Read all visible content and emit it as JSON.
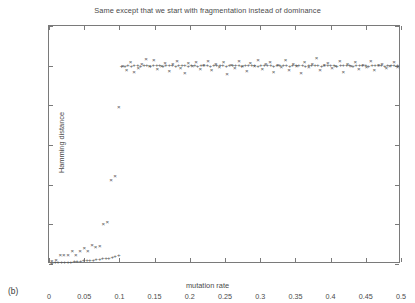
{
  "panel": {
    "label": "(b)"
  },
  "axes": {
    "y_title": "Hamming distance",
    "x_title": "mutation rate",
    "y_ticks": [
      "0",
      "0.1",
      "0.2",
      "0.3",
      "0.4",
      "0.5",
      "0.6"
    ],
    "x_ticks": [
      "0",
      "0.05",
      "0.1",
      "0.15",
      "0.2",
      "0.25",
      "0.3",
      "0.35",
      "0.4",
      "0.45",
      "0.5"
    ]
  },
  "colors": {
    "frame": "#7a7a7a",
    "marker": "#555555",
    "text": "#4a4a4a",
    "background": "#ffffff"
  },
  "chart_data": {
    "type": "scatter",
    "title": "Same except that we start with fragmentation instead of dominance",
    "xlabel": "mutation rate",
    "ylabel": "Hamming distance",
    "xlim": [
      0,
      0.5
    ],
    "ylim": [
      0,
      0.6
    ],
    "xticks": [
      0,
      0.05,
      0.1,
      0.15,
      0.2,
      0.25,
      0.3,
      0.35,
      0.4,
      0.45,
      0.5
    ],
    "yticks": [
      0,
      0.1,
      0.2,
      0.3,
      0.4,
      0.5,
      0.6
    ],
    "grid": false,
    "legend": null,
    "series": [
      {
        "name": "plus-series",
        "marker": "+",
        "points": [
          [
            0.004,
            0.002
          ],
          [
            0.009,
            0.003
          ],
          [
            0.013,
            0.003
          ],
          [
            0.018,
            0.004
          ],
          [
            0.022,
            0.004
          ],
          [
            0.027,
            0.005
          ],
          [
            0.031,
            0.005
          ],
          [
            0.036,
            0.006
          ],
          [
            0.04,
            0.006
          ],
          [
            0.045,
            0.007
          ],
          [
            0.049,
            0.008
          ],
          [
            0.054,
            0.008
          ],
          [
            0.058,
            0.009
          ],
          [
            0.063,
            0.01
          ],
          [
            0.067,
            0.011
          ],
          [
            0.072,
            0.012
          ],
          [
            0.076,
            0.013
          ],
          [
            0.081,
            0.014
          ],
          [
            0.085,
            0.015
          ],
          [
            0.09,
            0.016
          ],
          [
            0.094,
            0.018
          ],
          [
            0.099,
            0.021
          ],
          [
            0.103,
            0.497
          ],
          [
            0.108,
            0.499
          ],
          [
            0.112,
            0.5
          ],
          [
            0.117,
            0.499
          ],
          [
            0.121,
            0.5
          ],
          [
            0.126,
            0.501
          ],
          [
            0.13,
            0.499
          ],
          [
            0.135,
            0.5
          ],
          [
            0.139,
            0.5
          ],
          [
            0.144,
            0.499
          ],
          [
            0.148,
            0.501
          ],
          [
            0.153,
            0.5
          ],
          [
            0.157,
            0.5
          ],
          [
            0.162,
            0.499
          ],
          [
            0.166,
            0.5
          ],
          [
            0.171,
            0.501
          ],
          [
            0.175,
            0.5
          ],
          [
            0.18,
            0.499
          ],
          [
            0.184,
            0.5
          ],
          [
            0.189,
            0.5
          ],
          [
            0.193,
            0.501
          ],
          [
            0.198,
            0.499
          ],
          [
            0.202,
            0.5
          ],
          [
            0.207,
            0.5
          ],
          [
            0.211,
            0.499
          ],
          [
            0.216,
            0.5
          ],
          [
            0.22,
            0.501
          ],
          [
            0.225,
            0.5
          ],
          [
            0.229,
            0.499
          ],
          [
            0.234,
            0.5
          ],
          [
            0.238,
            0.5
          ],
          [
            0.243,
            0.501
          ],
          [
            0.247,
            0.5
          ],
          [
            0.252,
            0.499
          ],
          [
            0.256,
            0.5
          ],
          [
            0.261,
            0.5
          ],
          [
            0.265,
            0.501
          ],
          [
            0.27,
            0.5
          ],
          [
            0.274,
            0.499
          ],
          [
            0.279,
            0.5
          ],
          [
            0.283,
            0.5
          ],
          [
            0.288,
            0.501
          ],
          [
            0.292,
            0.5
          ],
          [
            0.297,
            0.499
          ],
          [
            0.301,
            0.5
          ],
          [
            0.306,
            0.5
          ],
          [
            0.31,
            0.501
          ],
          [
            0.315,
            0.5
          ],
          [
            0.319,
            0.499
          ],
          [
            0.324,
            0.5
          ],
          [
            0.328,
            0.5
          ],
          [
            0.333,
            0.501
          ],
          [
            0.337,
            0.5
          ],
          [
            0.342,
            0.499
          ],
          [
            0.346,
            0.5
          ],
          [
            0.351,
            0.5
          ],
          [
            0.355,
            0.501
          ],
          [
            0.36,
            0.5
          ],
          [
            0.364,
            0.499
          ],
          [
            0.369,
            0.5
          ],
          [
            0.373,
            0.5
          ],
          [
            0.378,
            0.501
          ],
          [
            0.382,
            0.5
          ],
          [
            0.387,
            0.499
          ],
          [
            0.391,
            0.5
          ],
          [
            0.396,
            0.5
          ],
          [
            0.4,
            0.501
          ],
          [
            0.405,
            0.5
          ],
          [
            0.409,
            0.499
          ],
          [
            0.414,
            0.5
          ],
          [
            0.418,
            0.5
          ],
          [
            0.423,
            0.501
          ],
          [
            0.427,
            0.5
          ],
          [
            0.432,
            0.499
          ],
          [
            0.436,
            0.5
          ],
          [
            0.441,
            0.5
          ],
          [
            0.445,
            0.501
          ],
          [
            0.45,
            0.5
          ],
          [
            0.454,
            0.499
          ],
          [
            0.459,
            0.5
          ],
          [
            0.463,
            0.5
          ],
          [
            0.468,
            0.501
          ],
          [
            0.472,
            0.5
          ],
          [
            0.477,
            0.499
          ],
          [
            0.481,
            0.5
          ],
          [
            0.486,
            0.5
          ],
          [
            0.49,
            0.501
          ],
          [
            0.495,
            0.5
          ]
        ]
      },
      {
        "name": "cross-series",
        "marker": "×",
        "points": [
          [
            0.004,
            0.006
          ],
          [
            0.01,
            0.01
          ],
          [
            0.016,
            0.021
          ],
          [
            0.021,
            0.021
          ],
          [
            0.027,
            0.022
          ],
          [
            0.033,
            0.031
          ],
          [
            0.038,
            0.022
          ],
          [
            0.044,
            0.031
          ],
          [
            0.05,
            0.039
          ],
          [
            0.055,
            0.033
          ],
          [
            0.061,
            0.047
          ],
          [
            0.066,
            0.042
          ],
          [
            0.072,
            0.044
          ],
          [
            0.077,
            0.101
          ],
          [
            0.083,
            0.105
          ],
          [
            0.088,
            0.21
          ],
          [
            0.094,
            0.221
          ],
          [
            0.099,
            0.394
          ],
          [
            0.105,
            0.498
          ],
          [
            0.11,
            0.489
          ],
          [
            0.116,
            0.508
          ],
          [
            0.121,
            0.484
          ],
          [
            0.127,
            0.492
          ],
          [
            0.132,
            0.504
          ],
          [
            0.138,
            0.516
          ],
          [
            0.143,
            0.497
          ],
          [
            0.149,
            0.513
          ],
          [
            0.154,
            0.49
          ],
          [
            0.16,
            0.499
          ],
          [
            0.165,
            0.506
          ],
          [
            0.171,
            0.486
          ],
          [
            0.176,
            0.502
          ],
          [
            0.182,
            0.511
          ],
          [
            0.187,
            0.494
          ],
          [
            0.193,
            0.481
          ],
          [
            0.198,
            0.505
          ],
          [
            0.204,
            0.498
          ],
          [
            0.209,
            0.509
          ],
          [
            0.215,
            0.49
          ],
          [
            0.22,
            0.5
          ],
          [
            0.226,
            0.512
          ],
          [
            0.231,
            0.487
          ],
          [
            0.237,
            0.503
          ],
          [
            0.242,
            0.496
          ],
          [
            0.248,
            0.508
          ],
          [
            0.253,
            0.479
          ],
          [
            0.259,
            0.501
          ],
          [
            0.264,
            0.493
          ],
          [
            0.27,
            0.51
          ],
          [
            0.275,
            0.499
          ],
          [
            0.281,
            0.486
          ],
          [
            0.286,
            0.505
          ],
          [
            0.292,
            0.497
          ],
          [
            0.297,
            0.513
          ],
          [
            0.303,
            0.491
          ],
          [
            0.308,
            0.502
          ],
          [
            0.314,
            0.507
          ],
          [
            0.319,
            0.483
          ],
          [
            0.325,
            0.5
          ],
          [
            0.33,
            0.496
          ],
          [
            0.336,
            0.514
          ],
          [
            0.341,
            0.489
          ],
          [
            0.347,
            0.504
          ],
          [
            0.352,
            0.498
          ],
          [
            0.358,
            0.48
          ],
          [
            0.363,
            0.509
          ],
          [
            0.369,
            0.495
          ],
          [
            0.374,
            0.502
          ],
          [
            0.38,
            0.518
          ],
          [
            0.385,
            0.488
          ],
          [
            0.391,
            0.5
          ],
          [
            0.396,
            0.506
          ],
          [
            0.402,
            0.492
          ],
          [
            0.407,
            0.499
          ],
          [
            0.413,
            0.511
          ],
          [
            0.418,
            0.484
          ],
          [
            0.424,
            0.503
          ],
          [
            0.429,
            0.497
          ],
          [
            0.435,
            0.508
          ],
          [
            0.44,
            0.49
          ],
          [
            0.446,
            0.501
          ],
          [
            0.451,
            0.495
          ],
          [
            0.457,
            0.512
          ],
          [
            0.462,
            0.487
          ],
          [
            0.468,
            0.5
          ],
          [
            0.473,
            0.504
          ],
          [
            0.479,
            0.493
          ],
          [
            0.484,
            0.499
          ],
          [
            0.49,
            0.507
          ],
          [
            0.495,
            0.496
          ]
        ]
      }
    ]
  }
}
